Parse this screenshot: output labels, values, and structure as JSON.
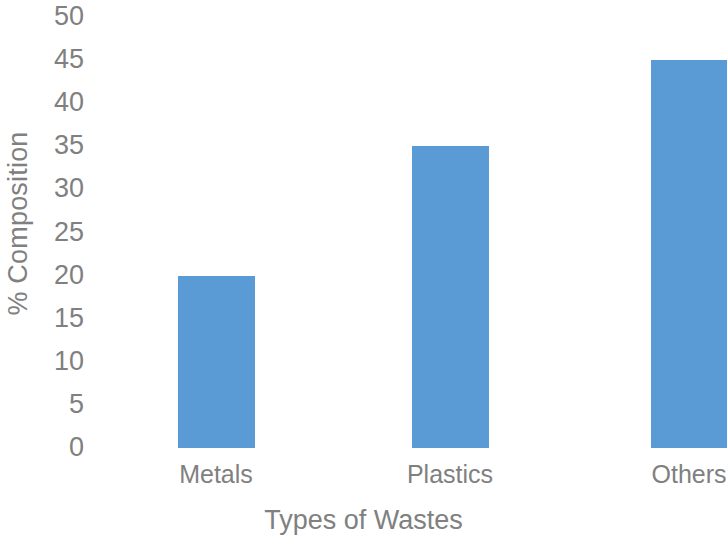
{
  "chart_data": {
    "type": "bar",
    "title": "",
    "subtitle": "",
    "categories": [
      "Metals",
      "Plastics",
      "Others"
    ],
    "values": [
      20,
      35,
      45
    ],
    "xlabel": "Types of Wastes",
    "ylabel": "% Composition",
    "ylim": [
      0,
      50
    ],
    "ytick_labels": [
      "50",
      "45",
      "40",
      "35",
      "30",
      "25",
      "20",
      "15",
      "10",
      "5",
      "0"
    ],
    "ytick_values": [
      50,
      45,
      40,
      35,
      30,
      25,
      20,
      15,
      10,
      5,
      0
    ],
    "ytick_step": 5,
    "grid": false,
    "legend": false,
    "legend_position": "none",
    "series": [
      {
        "name": "% Composition",
        "values": [
          20,
          35,
          45
        ]
      }
    ],
    "colors": {
      "bar": "#5B9BD5",
      "text": "#808080",
      "background": "#FFFFFF"
    },
    "bar_geometry": [
      {
        "category": "Metals",
        "value": 20,
        "left": 86,
        "width": 77
      },
      {
        "category": "Plastics",
        "value": 35,
        "left": 320,
        "width": 77
      },
      {
        "category": "Others",
        "value": 45,
        "left": 559,
        "width": 77
      }
    ],
    "category_label_x": [
      216,
      450,
      689
    ]
  }
}
